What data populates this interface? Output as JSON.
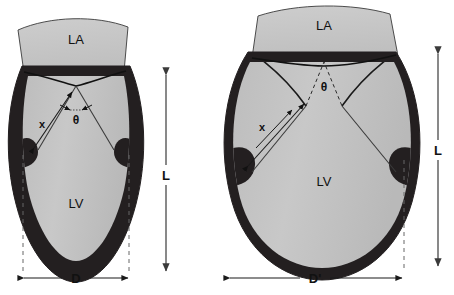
{
  "figure": {
    "type": "anatomical-diagram",
    "panels": [
      {
        "id": "normal-heart",
        "position": "left",
        "chambers": [
          {
            "name": "left-atrium",
            "label": "LA"
          },
          {
            "name": "left-ventricle",
            "label": "LV"
          }
        ],
        "annotations": [
          {
            "name": "papillary-distance",
            "label": "x",
            "kind": "double-arrow"
          },
          {
            "name": "leaflet-angle",
            "label": "θ",
            "kind": "angle"
          },
          {
            "name": "ventricle-length",
            "label": "L",
            "kind": "vertical-dimension"
          },
          {
            "name": "ventricle-diameter",
            "label": "D",
            "kind": "horizontal-dimension"
          }
        ]
      },
      {
        "id": "dilated-heart",
        "position": "right",
        "chambers": [
          {
            "name": "left-atrium",
            "label": "LA"
          },
          {
            "name": "left-ventricle",
            "label": "LV"
          }
        ],
        "annotations": [
          {
            "name": "papillary-distance",
            "label": "x",
            "kind": "double-arrow"
          },
          {
            "name": "leaflet-angle",
            "label": "θ",
            "kind": "angle"
          },
          {
            "name": "ventricle-length",
            "label": "L",
            "kind": "vertical-dimension"
          },
          {
            "name": "ventricle-diameter",
            "label": "D'",
            "kind": "horizontal-dimension"
          }
        ]
      }
    ],
    "colors": {
      "background": "#ffffff",
      "myocardium": "#231f20",
      "cavity": "#c3c3c3",
      "atrium": "#c8c8c8",
      "outline": "#1a1a1a",
      "annotation": "#1a1a1a",
      "guide": "#555555"
    }
  },
  "left_panel": {
    "la_label": "LA",
    "lv_label": "LV",
    "x_label": "x",
    "theta_label": "θ",
    "l_label": "L",
    "d_label": "D"
  },
  "right_panel": {
    "la_label": "LA",
    "lv_label": "LV",
    "x_label": "x",
    "theta_label": "θ",
    "l_label": "L",
    "d_label": "D'"
  }
}
